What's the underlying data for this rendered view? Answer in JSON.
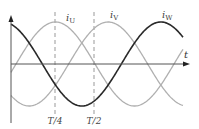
{
  "diagram": {
    "type": "three-phase-sinusoid",
    "axes": {
      "origin_x": 11,
      "zero_y": 64,
      "y_top": 15,
      "y_bottom": 123,
      "x_end": 190,
      "x_label": "t",
      "color": "#555555"
    },
    "wave": {
      "x0": 16,
      "period_px": 158,
      "amplitude_px": 42,
      "x_start": 11,
      "x_end": 183
    },
    "series": [
      {
        "name": "iU",
        "label_main": "i",
        "label_sub": "U",
        "phase_deg": 0,
        "color": "#b0b0b0",
        "width": 1.3,
        "label_x": 66,
        "label_y": 21
      },
      {
        "name": "iV",
        "label_main": "i",
        "label_sub": "V",
        "phase_deg": -120,
        "color": "#b0b0b0",
        "width": 1.3,
        "label_x": 110,
        "label_y": 18
      },
      {
        "name": "iW",
        "label_main": "i",
        "label_sub": "W",
        "phase_deg": -240,
        "color": "#2a2a2a",
        "width": 1.6,
        "label_x": 162,
        "label_y": 18
      }
    ],
    "markers": [
      {
        "label": "T/4",
        "x": 55,
        "label_y": 124
      },
      {
        "label": "T/2",
        "x": 94,
        "label_y": 124
      }
    ],
    "marker_style": {
      "color": "#999999",
      "dash": "4,3",
      "y_top": 12,
      "y_bottom": 114
    }
  }
}
